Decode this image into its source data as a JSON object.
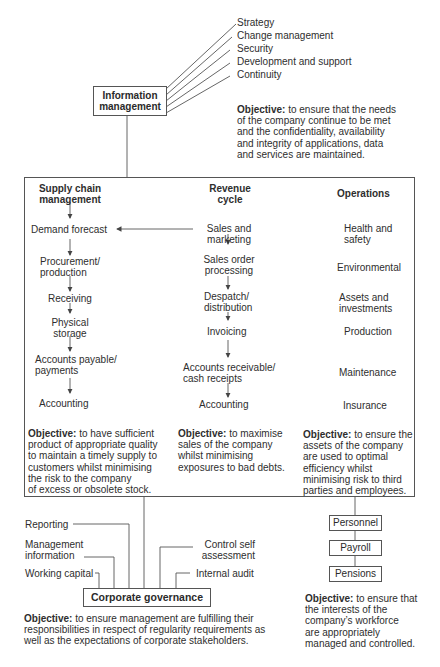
{
  "information_management": {
    "title_line1": "Information",
    "title_line2": "management",
    "areas": [
      "Strategy",
      "Change management",
      "Security",
      "Development and support",
      "Continuity"
    ],
    "objective_label": "Objective:",
    "objective_lines": [
      " to ensure that the needs",
      "of the company continue to be met",
      "and the confidentiality, availability",
      "and integrity of applications, data",
      "and services are maintained."
    ]
  },
  "supply_chain": {
    "title_line1": "Supply chain",
    "title_line2": "management",
    "steps": [
      [
        "Demand forecast"
      ],
      [
        "Procurement/",
        "production"
      ],
      [
        "Receiving"
      ],
      [
        "Physical",
        "storage"
      ],
      [
        "Accounts payable/",
        "payments"
      ],
      [
        "Accounting"
      ]
    ],
    "objective_label": "Objective:",
    "objective_lines": [
      " to have sufficient",
      "product of appropriate quality",
      "to maintain a timely supply to",
      "customers whilst minimising",
      "the risk to the company",
      "of excess or obsolete stock."
    ]
  },
  "revenue_cycle": {
    "title_line1": "Revenue",
    "title_line2": "cycle",
    "steps": [
      [
        "Sales and",
        "marketing"
      ],
      [
        "Sales order",
        "processing"
      ],
      [
        "Despatch/",
        "distribution"
      ],
      [
        "Invoicing"
      ],
      [
        "Accounts receivable/",
        "cash receipts"
      ],
      [
        "Accounting"
      ]
    ],
    "objective_label": "Objective:",
    "objective_lines": [
      " to maximise",
      "sales of the company",
      "whilst minimising",
      "exposures to bad debts."
    ]
  },
  "operations": {
    "title": "Operations",
    "items": [
      [
        "Health and",
        "safety"
      ],
      [
        "Environmental"
      ],
      [
        "Assets and",
        "investments"
      ],
      [
        "Production"
      ],
      [
        "Maintenance"
      ],
      [
        "Insurance"
      ]
    ],
    "objective_label": "Objective:",
    "objective_lines": [
      " to ensure the",
      "assets of the company",
      "are used to optimal",
      "efficiency whilst",
      "minimising risk to third",
      "parties and employees."
    ]
  },
  "corporate_governance": {
    "title": "Corporate governance",
    "areas_left": [
      [
        "Reporting"
      ],
      [
        "Management",
        "information"
      ],
      [
        "Working capital"
      ]
    ],
    "areas_right": [
      [
        "Control self",
        "assessment"
      ],
      [
        "Internal audit"
      ]
    ],
    "objective_label": "Objective:",
    "objective_lines": [
      " to ensure management are fulfilling their",
      "responsibilities in respect of regularity requirements as",
      "well as the expectations of corporate stakeholders."
    ]
  },
  "human_resources": {
    "items": [
      "Personnel",
      "Payroll",
      "Pensions"
    ],
    "objective_label": "Objective:",
    "objective_lines": [
      " to ensure that",
      "the interests of the",
      "company’s workforce",
      "are appropriately",
      "managed and controlled."
    ]
  },
  "colors": {
    "line": "#555555",
    "text": "#2e2e2e",
    "background": "#ffffff"
  }
}
